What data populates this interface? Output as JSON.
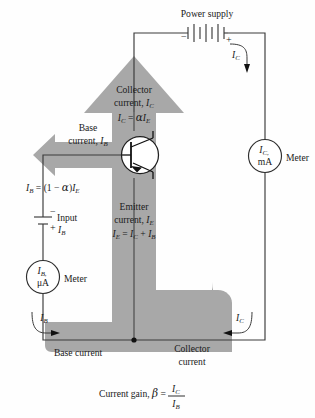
{
  "figure": {
    "colors": {
      "flow_band": "#a8a8a8",
      "wire": "#3a3a3a",
      "text": "#1a1a1a",
      "background": "#ffffff"
    }
  },
  "labels": {
    "power_supply": "Power supply",
    "collector_current_line1": "Collector",
    "collector_current_line2": "current, ",
    "collector_current_symbol": "I",
    "collector_current_sub": "C",
    "collector_eq_lhs": "I",
    "collector_eq_lhs_sub": "C",
    "collector_eq_mid": " = ",
    "collector_eq_alpha": "α",
    "collector_eq_rhs": "I",
    "collector_eq_rhs_sub": "E",
    "base_current_line1": "Base",
    "base_current_line2": "current, ",
    "base_current_symbol": "I",
    "base_current_sub": "B",
    "base_eq_lhs": "I",
    "base_eq_lhs_sub": "B",
    "base_eq_mid": " = (1 − ",
    "base_eq_alpha": "α",
    "base_eq_close": ")",
    "base_eq_rhs": "I",
    "base_eq_rhs_sub": "E",
    "emitter_current_line1": "Emitter",
    "emitter_current_line2": "current, ",
    "emitter_current_symbol": "I",
    "emitter_current_sub": "E",
    "emitter_eq_lhs": "I",
    "emitter_eq_lhs_sub": "E",
    "emitter_eq_mid": " = ",
    "emitter_eq_t1": "I",
    "emitter_eq_t1_sub": "C",
    "emitter_eq_plus": " + ",
    "emitter_eq_t2": "I",
    "emitter_eq_t2_sub": "B",
    "input_label": "Input",
    "input_current_symbol": "I",
    "input_current_sub": "B",
    "meter_right_label": "Meter",
    "meter_left_label": "Meter",
    "meter_right_symbol": "I",
    "meter_right_sub": "C,",
    "meter_right_unit": "mA",
    "meter_left_symbol": "I",
    "meter_left_sub": "B,",
    "meter_left_unit": "μA",
    "ic_arrow_top": "I",
    "ic_arrow_top_sub": "C",
    "ic_arrow_bottom": "I",
    "ic_arrow_bottom_sub": "C",
    "ib_arrow_bottom": "I",
    "ib_arrow_bottom_sub": "B",
    "base_current_bottom": "Base current",
    "collector_current_bottom_line1": "Collector",
    "collector_current_bottom_line2": "current",
    "gain_prefix": "Current gain, ",
    "gain_beta": "β",
    "gain_eq": " = ",
    "gain_num": "I",
    "gain_num_sub": "C",
    "gain_den": "I",
    "gain_den_sub": "B",
    "battery_minus": "−",
    "battery_plus": "+",
    "input_minus": "−",
    "input_plus": "+"
  }
}
